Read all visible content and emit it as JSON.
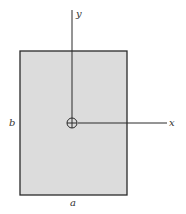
{
  "diagram": {
    "type": "rectangular cross-section with centroidal axes",
    "colors": {
      "fill": "#dcdcdc",
      "stroke": "#2a2a2a",
      "axis": "#2a2a2a",
      "label": "#333333"
    },
    "rectangle": {
      "x": 20,
      "y": 51,
      "width": 107,
      "height": 144
    },
    "centroid": {
      "x": 72,
      "y": 123,
      "r": 5,
      "symbol": "circle-cross"
    },
    "axes": {
      "y": {
        "label": "y",
        "x": 72,
        "y_top": 10,
        "y_bottom": 118
      },
      "x": {
        "label": "x",
        "y": 123,
        "x_start": 78,
        "x_end": 167
      }
    },
    "dimension_labels": {
      "width": "a",
      "height": "b"
    }
  }
}
